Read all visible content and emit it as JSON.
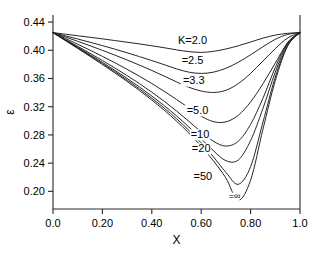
{
  "chart_data": {
    "type": "line",
    "title": "",
    "subtitle": "",
    "xlabel": "X",
    "ylabel": "ε",
    "xlim": [
      0.0,
      1.0
    ],
    "ylim": [
      0.175,
      0.45
    ],
    "grid": false,
    "legend_position": "inline-curve-labels",
    "xticks": [
      0.0,
      0.2,
      0.4,
      0.6,
      0.8,
      1.0
    ],
    "xtick_labels": [
      "0.0",
      "0.20",
      "0.40",
      "0.60",
      "0.80",
      "1.0"
    ],
    "yticks": [
      0.2,
      0.24,
      0.28,
      0.32,
      0.36,
      0.4,
      0.44
    ],
    "ytick_labels": [
      "0.20",
      "0.24",
      "0.28",
      "0.32",
      "0.36",
      "0.40",
      "0.44"
    ],
    "endpoint_value": 0.425,
    "series": [
      {
        "name": "K=2.0",
        "label": "K=2.0",
        "label_x": 0.565,
        "label_y": 0.409,
        "min_x": 0.6,
        "min_y": 0.397,
        "x": [
          0.0,
          0.05,
          0.1,
          0.15,
          0.2,
          0.25,
          0.3,
          0.35,
          0.4,
          0.45,
          0.5,
          0.55,
          0.6,
          0.65,
          0.7,
          0.75,
          0.8,
          0.85,
          0.9,
          0.95,
          1.0
        ],
        "y": [
          0.425,
          0.4228,
          0.4206,
          0.4184,
          0.4162,
          0.4138,
          0.4114,
          0.409,
          0.4064,
          0.4036,
          0.4006,
          0.3981,
          0.397,
          0.3985,
          0.4018,
          0.4064,
          0.4117,
          0.4172,
          0.4215,
          0.424,
          0.425
        ]
      },
      {
        "name": "K=2.5",
        "label": "=2.5",
        "label_x": 0.565,
        "label_y": 0.38,
        "min_x": 0.615,
        "min_y": 0.367,
        "x": [
          0.0,
          0.05,
          0.1,
          0.15,
          0.2,
          0.25,
          0.3,
          0.35,
          0.4,
          0.45,
          0.5,
          0.55,
          0.6,
          0.65,
          0.7,
          0.75,
          0.8,
          0.85,
          0.9,
          0.95,
          1.0
        ],
        "y": [
          0.425,
          0.4205,
          0.416,
          0.4114,
          0.4066,
          0.4016,
          0.3964,
          0.391,
          0.3854,
          0.3796,
          0.3737,
          0.369,
          0.3672,
          0.369,
          0.3745,
          0.383,
          0.3936,
          0.405,
          0.4155,
          0.4225,
          0.425
        ]
      },
      {
        "name": "K=3.3",
        "label": "=3.3",
        "label_x": 0.57,
        "label_y": 0.352,
        "min_x": 0.635,
        "min_y": 0.34,
        "x": [
          0.0,
          0.05,
          0.1,
          0.15,
          0.2,
          0.25,
          0.3,
          0.35,
          0.4,
          0.45,
          0.5,
          0.55,
          0.6,
          0.65,
          0.7,
          0.75,
          0.8,
          0.85,
          0.9,
          0.95,
          1.0
        ],
        "y": [
          0.425,
          0.4189,
          0.4127,
          0.4064,
          0.3999,
          0.3932,
          0.3862,
          0.379,
          0.3714,
          0.3634,
          0.3552,
          0.3476,
          0.3422,
          0.3402,
          0.3432,
          0.3527,
          0.3672,
          0.3848,
          0.4023,
          0.4175,
          0.425
        ]
      },
      {
        "name": "K=5.0",
        "label": "=5.0",
        "label_x": 0.585,
        "label_y": 0.31,
        "min_x": 0.665,
        "min_y": 0.298,
        "x": [
          0.0,
          0.05,
          0.1,
          0.15,
          0.2,
          0.25,
          0.3,
          0.35,
          0.4,
          0.45,
          0.5,
          0.55,
          0.6,
          0.65,
          0.7,
          0.75,
          0.8,
          0.85,
          0.9,
          0.95,
          1.0
        ],
        "y": [
          0.425,
          0.4168,
          0.4086,
          0.4001,
          0.3914,
          0.3824,
          0.373,
          0.3632,
          0.3529,
          0.3419,
          0.3303,
          0.3182,
          0.3066,
          0.2988,
          0.2985,
          0.3078,
          0.3268,
          0.3525,
          0.3819,
          0.4105,
          0.425
        ]
      },
      {
        "name": "K=10",
        "label": "=10",
        "label_x": 0.595,
        "label_y": 0.276,
        "min_x": 0.685,
        "min_y": 0.264,
        "x": [
          0.0,
          0.05,
          0.1,
          0.15,
          0.2,
          0.25,
          0.3,
          0.35,
          0.4,
          0.45,
          0.5,
          0.55,
          0.6,
          0.65,
          0.7,
          0.75,
          0.8,
          0.85,
          0.9,
          0.95,
          1.0
        ],
        "y": [
          0.425,
          0.4153,
          0.4056,
          0.3957,
          0.3855,
          0.375,
          0.3641,
          0.3527,
          0.3406,
          0.3278,
          0.314,
          0.2993,
          0.2843,
          0.2709,
          0.2642,
          0.271,
          0.295,
          0.332,
          0.3755,
          0.411,
          0.425
        ]
      },
      {
        "name": "K=20",
        "label": "=20",
        "label_x": 0.6,
        "label_y": 0.256,
        "min_x": 0.695,
        "min_y": 0.24,
        "x": [
          0.0,
          0.05,
          0.1,
          0.15,
          0.2,
          0.25,
          0.3,
          0.35,
          0.4,
          0.45,
          0.5,
          0.55,
          0.6,
          0.65,
          0.7,
          0.75,
          0.8,
          0.85,
          0.9,
          0.95,
          1.0
        ],
        "y": [
          0.425,
          0.4147,
          0.4043,
          0.3937,
          0.3829,
          0.3717,
          0.3601,
          0.348,
          0.3352,
          0.3216,
          0.307,
          0.2913,
          0.2745,
          0.2575,
          0.2435,
          0.2445,
          0.272,
          0.3175,
          0.369,
          0.409,
          0.425
        ]
      },
      {
        "name": "K=50",
        "label": "=50",
        "label_x": 0.607,
        "label_y": 0.216,
        "min_x": 0.7,
        "min_y": 0.208,
        "x": [
          0.0,
          0.05,
          0.1,
          0.15,
          0.2,
          0.25,
          0.3,
          0.35,
          0.4,
          0.45,
          0.5,
          0.55,
          0.6,
          0.65,
          0.7,
          0.75,
          0.8,
          0.85,
          0.9,
          0.95,
          1.0
        ],
        "y": [
          0.425,
          0.4142,
          0.4034,
          0.3924,
          0.3812,
          0.3697,
          0.3578,
          0.3453,
          0.3321,
          0.3181,
          0.303,
          0.2866,
          0.2686,
          0.2487,
          0.227,
          0.21,
          0.235,
          0.298,
          0.362,
          0.407,
          0.425
        ]
      },
      {
        "name": "K=infinity",
        "label": "=∞",
        "label_x": 0.735,
        "label_y": 0.189,
        "min_x": 0.71,
        "min_y": 0.185,
        "x": [
          0.0,
          0.05,
          0.1,
          0.15,
          0.2,
          0.25,
          0.3,
          0.35,
          0.4,
          0.45,
          0.5,
          0.55,
          0.6,
          0.65,
          0.7,
          0.75,
          0.8,
          0.85,
          0.9,
          0.95,
          1.0
        ],
        "y": [
          0.425,
          0.4138,
          0.4026,
          0.3913,
          0.3798,
          0.368,
          0.3558,
          0.343,
          0.3295,
          0.3151,
          0.2996,
          0.2827,
          0.264,
          0.243,
          0.219,
          0.1875,
          0.216,
          0.288,
          0.357,
          0.406,
          0.425
        ]
      }
    ]
  }
}
